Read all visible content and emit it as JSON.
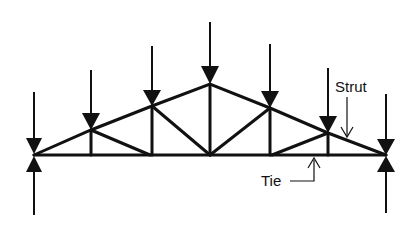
{
  "diagram": {
    "type": "roof truss with loads",
    "labels": {
      "strut": "Strut",
      "tie": "Tie"
    },
    "colors": {
      "line": "#111111",
      "background": "#ffffff"
    },
    "nodes": {
      "bottom_chord_y": 155,
      "top_nodes": [
        {
          "x": 34,
          "y": 155
        },
        {
          "x": 91,
          "y": 130
        },
        {
          "x": 152,
          "y": 106
        },
        {
          "x": 210,
          "y": 84
        },
        {
          "x": 270,
          "y": 108
        },
        {
          "x": 328,
          "y": 133
        },
        {
          "x": 386,
          "y": 155
        }
      ]
    },
    "loads": "downward arrows at each top-chord node; upward reactions at both supports"
  }
}
